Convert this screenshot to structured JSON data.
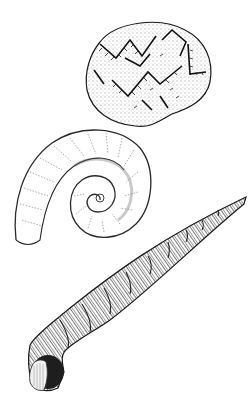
{
  "image": {
    "width": 250,
    "height": 402,
    "background": "#ffffff",
    "ink": "#1a1a1a",
    "style": "pen-and-ink scientific illustration"
  },
  "figures": [
    {
      "name": "reticulate-shell",
      "description": "rounded irregular shell with dark branching net pattern",
      "bbox": [
        85,
        18,
        212,
        128
      ]
    },
    {
      "name": "coiled-shell",
      "description": "loosely coiled planispiral shell with faint transverse ribs",
      "bbox": [
        13,
        128,
        152,
        248
      ]
    },
    {
      "name": "tower-shell",
      "description": "long tapering turreted shell with ribbed whorls and round aperture",
      "bbox": [
        28,
        195,
        246,
        394
      ]
    }
  ]
}
